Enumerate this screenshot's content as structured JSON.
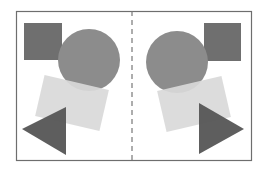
{
  "diagram": {
    "colors": {
      "frame": "#6e6e6e",
      "square": "#6f6f6f",
      "circle": "#8c8c8c",
      "rectangle": "#d9d9d9",
      "triangle": "#555555",
      "axis": "#777777",
      "background": "#ffffff"
    },
    "frame": {
      "x": 16,
      "y": 11,
      "width": 236,
      "height": 150
    },
    "axis": {
      "x": 132,
      "style": "dashed"
    },
    "left": {
      "square": {
        "x": 24,
        "y": 23,
        "size": 38
      },
      "circle": {
        "cx": 89,
        "cy": 60,
        "r": 31
      },
      "rectangle": {
        "cx": 72,
        "cy": 103,
        "w": 66,
        "h": 42,
        "rotate": 13
      },
      "triangle": {
        "points": "22,129 66,106 66,155"
      }
    },
    "right": {
      "square": {
        "x": 205,
        "y": 23,
        "size": 38
      },
      "circle": {
        "cx": 175,
        "cy": 67,
        "r": 31
      },
      "rectangle": {
        "cx": 194,
        "cy": 104,
        "w": 66,
        "h": 42,
        "rotate": -13
      },
      "triangle": {
        "points": "199,103 243,129 199,155"
      }
    }
  }
}
